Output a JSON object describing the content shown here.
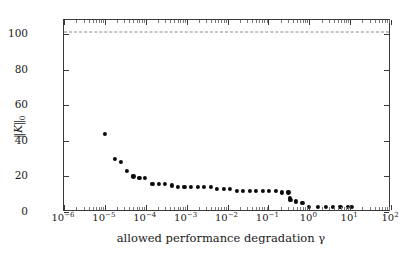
{
  "chart_data": {
    "type": "scatter",
    "title": "",
    "xlabel": "allowed performance degradation γ",
    "ylabel": "‖𝒦‖₀",
    "xscale": "log",
    "yscale": "linear",
    "xlim": [
      1e-06,
      100
    ],
    "ylim": [
      0,
      108
    ],
    "grid": false,
    "legend": null,
    "xticks": [
      {
        "value": 1e-06,
        "label": "10",
        "exp": "−6"
      },
      {
        "value": 1e-05,
        "label": "10",
        "exp": "−5"
      },
      {
        "value": 0.0001,
        "label": "10",
        "exp": "−4"
      },
      {
        "value": 0.001,
        "label": "10",
        "exp": "−3"
      },
      {
        "value": 0.01,
        "label": "10",
        "exp": "−2"
      },
      {
        "value": 0.1,
        "label": "10",
        "exp": "−1"
      },
      {
        "value": 1,
        "label": "10",
        "exp": "0"
      },
      {
        "value": 10,
        "label": "10",
        "exp": "1"
      },
      {
        "value": 100,
        "label": "10",
        "exp": "2"
      }
    ],
    "yticks": [
      {
        "value": 0,
        "label": "0"
      },
      {
        "value": 20,
        "label": "20"
      },
      {
        "value": 40,
        "label": "40"
      },
      {
        "value": 60,
        "label": "60"
      },
      {
        "value": 80,
        "label": "80"
      },
      {
        "value": 100,
        "label": "100"
      }
    ],
    "reference_line": {
      "name": "dense-controller-baseline",
      "value": 101.5,
      "style": "dashed",
      "color": "#8a8a8a"
    },
    "series": [
      {
        "name": "sparsity-vs-degradation",
        "marker": "circle",
        "color": "#0b0b0b",
        "points": [
          {
            "x": 1e-05,
            "y": 44
          },
          {
            "x": 1.75e-05,
            "y": 30
          },
          {
            "x": 2.45e-05,
            "y": 28
          },
          {
            "x": 3.5e-05,
            "y": 23
          },
          {
            "x": 5e-05,
            "y": 20
          },
          {
            "x": 7e-05,
            "y": 19
          },
          {
            "x": 9.5e-05,
            "y": 19
          },
          {
            "x": 0.000145,
            "y": 16
          },
          {
            "x": 0.00021,
            "y": 16
          },
          {
            "x": 0.0003,
            "y": 16
          },
          {
            "x": 0.00043,
            "y": 15
          },
          {
            "x": 0.00062,
            "y": 14
          },
          {
            "x": 0.00088,
            "y": 14
          },
          {
            "x": 0.0013,
            "y": 14
          },
          {
            "x": 0.00185,
            "y": 14
          },
          {
            "x": 0.0027,
            "y": 14
          },
          {
            "x": 0.0039,
            "y": 14
          },
          {
            "x": 0.0056,
            "y": 13
          },
          {
            "x": 0.008,
            "y": 13
          },
          {
            "x": 0.0115,
            "y": 13
          },
          {
            "x": 0.017,
            "y": 12
          },
          {
            "x": 0.024,
            "y": 12
          },
          {
            "x": 0.035,
            "y": 12
          },
          {
            "x": 0.05,
            "y": 12
          },
          {
            "x": 0.072,
            "y": 12
          },
          {
            "x": 0.105,
            "y": 12
          },
          {
            "x": 0.15,
            "y": 12
          },
          {
            "x": 0.215,
            "y": 11
          },
          {
            "x": 0.31,
            "y": 11
          },
          {
            "x": 0.33,
            "y": 8
          },
          {
            "x": 0.345,
            "y": 7
          },
          {
            "x": 0.48,
            "y": 6
          },
          {
            "x": 0.68,
            "y": 5
          },
          {
            "x": 1.0,
            "y": 3
          },
          {
            "x": 1.6,
            "y": 3
          },
          {
            "x": 2.5,
            "y": 3
          },
          {
            "x": 3.8,
            "y": 3
          },
          {
            "x": 5.8,
            "y": 3
          },
          {
            "x": 8.8,
            "y": 3
          },
          {
            "x": 11.0,
            "y": 3
          }
        ]
      }
    ]
  },
  "figure": {
    "background_color": "#ffffff",
    "axis_color": "#3a3a3a",
    "marker_color": "#0b0b0b"
  }
}
